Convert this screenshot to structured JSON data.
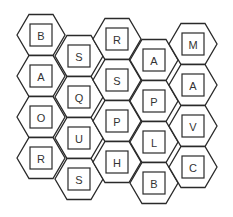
{
  "puzzle": {
    "title": "",
    "columns": [
      {
        "letters": [
          "B",
          "A",
          "O",
          "R"
        ]
      },
      {
        "letters": [
          "S",
          "Q",
          "U",
          "S"
        ]
      },
      {
        "letters": [
          "R",
          "S",
          "P",
          "H"
        ]
      },
      {
        "letters": [
          "A",
          "P",
          "L",
          "B"
        ]
      },
      {
        "letters": [
          "M",
          "A",
          "V",
          "C"
        ]
      }
    ]
  },
  "colors": {
    "stroke": "#2a2a2a",
    "text": "#333333",
    "background": "#ffffff"
  }
}
